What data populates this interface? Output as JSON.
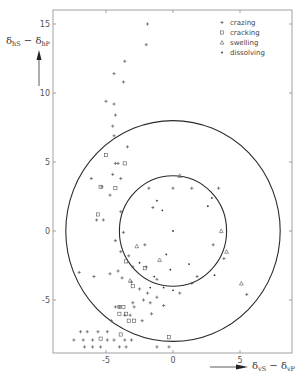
{
  "chart_data": {
    "type": "scatter",
    "title": "",
    "xlabel": "δvS − δvP",
    "ylabel": "δhS − δhP",
    "xlim": [
      -8,
      10.5
    ],
    "ylim": [
      -8.4,
      16
    ],
    "x_ticks": [
      -5,
      0,
      5
    ],
    "y_ticks": [
      15,
      10,
      5,
      0,
      -5
    ],
    "x_tick_labels": [
      "-5",
      "0",
      "5"
    ],
    "y_tick_labels": [
      "15",
      "10",
      "5",
      "0",
      "-5"
    ],
    "grid": false,
    "legend_position": "upper right",
    "circles": [
      {
        "name": "inner",
        "center": [
          0,
          0
        ],
        "radius": 4
      },
      {
        "name": "outer",
        "center": [
          0,
          0
        ],
        "radius": 8
      }
    ],
    "series": [
      {
        "name": "crazing",
        "marker": "plus",
        "points": [
          [
            -1.9,
            15.0
          ],
          [
            -2.0,
            13.5
          ],
          [
            -3.6,
            12.3
          ],
          [
            -4.4,
            11.4
          ],
          [
            -3.7,
            10.8
          ],
          [
            -5.0,
            9.4
          ],
          [
            -4.4,
            9.2
          ],
          [
            -4.3,
            8.4
          ],
          [
            -4.5,
            7.6
          ],
          [
            -4.4,
            6.9
          ],
          [
            -3.4,
            6.1
          ],
          [
            -4.3,
            4.9
          ],
          [
            -4.1,
            4.9
          ],
          [
            -4.5,
            4.1
          ],
          [
            -6.1,
            3.8
          ],
          [
            -3.9,
            3.8
          ],
          [
            -5.3,
            3.2
          ],
          [
            -4.7,
            2.6
          ],
          [
            -5.7,
            0.8
          ],
          [
            -5.2,
            0.8
          ],
          [
            -3.9,
            1.4
          ],
          [
            -3.7,
            -0.1
          ],
          [
            -4.3,
            -0.7
          ],
          [
            -3.9,
            -1.5
          ],
          [
            -3.3,
            -1.8
          ],
          [
            -3.0,
            -2.6
          ],
          [
            -4.1,
            -2.9
          ],
          [
            -4.7,
            -3.1
          ],
          [
            -3.8,
            -3.4
          ],
          [
            -3.1,
            -3.7
          ],
          [
            -2.5,
            -4.2
          ],
          [
            -1.9,
            -4.5
          ],
          [
            -1.7,
            -5.2
          ],
          [
            -1.6,
            -6.0
          ],
          [
            -2.3,
            -6.5
          ],
          [
            -3.2,
            -6.1
          ],
          [
            -3.6,
            -6.1
          ],
          [
            -4.6,
            -6.5
          ],
          [
            -3.0,
            -5.2
          ],
          [
            -2.2,
            -5.0
          ],
          [
            -5.9,
            -3.3
          ],
          [
            -7.0,
            -3.0
          ],
          [
            -6.4,
            -7.3
          ],
          [
            -6.9,
            -7.3
          ],
          [
            -5.6,
            -7.3
          ],
          [
            -4.9,
            -7.3
          ],
          [
            -7.4,
            -7.9
          ],
          [
            -6.7,
            -7.9
          ],
          [
            -6.0,
            -7.9
          ],
          [
            -4.9,
            -7.9
          ],
          [
            -4.4,
            -7.9
          ],
          [
            -3.6,
            -7.9
          ],
          [
            -3.1,
            -7.9
          ],
          [
            -6.6,
            -8.4
          ],
          [
            -6.0,
            -8.4
          ],
          [
            -5.4,
            -8.4
          ],
          [
            -4.0,
            -8.4
          ],
          [
            -3.5,
            -8.4
          ],
          [
            -1.2,
            -8.4
          ],
          [
            -0.3,
            -8.4
          ],
          [
            -4.3,
            -5.5
          ],
          [
            -4.0,
            -5.5
          ],
          [
            -2.9,
            -5.5
          ],
          [
            -1.2,
            -4.8
          ],
          [
            -0.7,
            -5.4
          ],
          [
            1.4,
            -3.8
          ],
          [
            1.8,
            -3.3
          ],
          [
            3.0,
            -1.0
          ],
          [
            3.8,
            -2.0
          ],
          [
            3.4,
            3.1
          ],
          [
            1.4,
            3.1
          ],
          [
            0.0,
            3.1
          ],
          [
            -1.8,
            3.1
          ],
          [
            -2.0,
            -2.6
          ],
          [
            -1.2,
            -3.5
          ],
          [
            0.5,
            -4.5
          ],
          [
            5.5,
            -4.6
          ],
          [
            -1.5,
            1.7
          ],
          [
            -2.1,
            -1.0
          ]
        ]
      },
      {
        "name": "cracking",
        "marker": "square",
        "points": [
          [
            -5.0,
            5.5
          ],
          [
            -3.6,
            4.9
          ],
          [
            -5.4,
            3.2
          ],
          [
            -4.3,
            3.1
          ],
          [
            -5.6,
            1.2
          ],
          [
            -3.5,
            -2.2
          ],
          [
            -2.1,
            -2.7
          ],
          [
            -3.0,
            -4.0
          ],
          [
            -4.0,
            -6.0
          ],
          [
            -3.5,
            -6.0
          ],
          [
            -3.3,
            -6.5
          ],
          [
            -2.9,
            -6.5
          ],
          [
            -3.9,
            -7.5
          ],
          [
            -5.4,
            -7.8
          ],
          [
            -0.3,
            -7.7
          ],
          [
            -4.0,
            -5.5
          ],
          [
            -3.7,
            -5.5
          ]
        ]
      },
      {
        "name": "swelling",
        "marker": "triangle",
        "points": [
          [
            0.5,
            4.0
          ],
          [
            -3.2,
            -3.6
          ],
          [
            -2.7,
            -1.1
          ],
          [
            3.6,
            0.0
          ],
          [
            -1.0,
            -2.1
          ],
          [
            5.1,
            -3.8
          ],
          [
            4.0,
            -1.5
          ]
        ]
      },
      {
        "name": "dissolving",
        "marker": "dot",
        "points": [
          [
            0.0,
            0.0
          ],
          [
            -1.2,
            2.2
          ],
          [
            -0.8,
            1.5
          ],
          [
            2.6,
            1.8
          ],
          [
            -0.2,
            -2.8
          ],
          [
            2.9,
            2.4
          ],
          [
            3.1,
            -3.2
          ],
          [
            1.2,
            -2.4
          ],
          [
            -1.7,
            -4.1
          ],
          [
            -0.7,
            -4.1
          ],
          [
            0.0,
            -4.3
          ],
          [
            -2.5,
            -2.3
          ],
          [
            -1.4,
            -3.3
          ],
          [
            -0.5,
            -1.7
          ]
        ]
      }
    ],
    "legend": [
      {
        "label": "crazing",
        "marker": "plus"
      },
      {
        "label": "cracking",
        "marker": "square"
      },
      {
        "label": "swelling",
        "marker": "triangle"
      },
      {
        "label": "dissolving",
        "marker": "dot"
      }
    ]
  },
  "axes": {
    "x_label_main": "δ",
    "x_label_sub1": "vS",
    "x_label_mid": " − δ",
    "x_label_sub2": "vP",
    "y_label_main": "δ",
    "y_label_sub1": "hS",
    "y_label_mid": " − δ",
    "y_label_sub2": "hP"
  },
  "colors": {
    "ink": "#2a2a2a",
    "frame": "#8a8a8a",
    "point": "#555555",
    "background": "#ffffff"
  }
}
